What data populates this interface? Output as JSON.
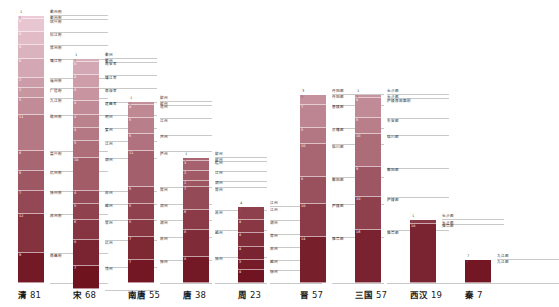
{
  "chart_data": {
    "type": "bar",
    "title": "",
    "subtitle": "",
    "xlabel": "",
    "ylabel": "",
    "orientation": "vertical-stacked",
    "grid": false,
    "legend": "none",
    "axis_note": "segment heights proportional to segment value; total shown under each bar",
    "categories": [
      "清",
      "宋",
      "南唐",
      "唐",
      "周",
      "晋",
      "三国",
      "西汉",
      "秦"
    ],
    "values": [
      81,
      68,
      55,
      38,
      23,
      57,
      57,
      19,
      7
    ],
    "colors": {
      "gradient_top": "#f0d2dd",
      "gradient_bottom": "#6d0f1c",
      "rule": "#c9c9c9",
      "segment_text_light": "#ffffff",
      "segment_text_dark": "#8a5a66",
      "label_text": "#2b2b2b",
      "footer_text": "#1a1a1a"
    },
    "series": [
      {
        "name": "清",
        "total": 81,
        "segments": [
          {
            "value": 1,
            "label": "衢州府"
          },
          {
            "value": 4,
            "label": "绍兴府"
          },
          {
            "value": 4,
            "label": "松江府"
          },
          {
            "value": 4,
            "label": "常州府"
          },
          {
            "value": 6,
            "label": "镇江府"
          },
          {
            "value": 3,
            "label": "福州府"
          },
          {
            "value": 3,
            "label": "广信府"
          },
          {
            "value": 5,
            "label": "九江府"
          },
          {
            "value": 11,
            "label": "徽州府"
          },
          {
            "value": 6,
            "label": "嘉兴府"
          },
          {
            "value": 6,
            "label": "杭州府"
          },
          {
            "value": 7,
            "label": "扬州府"
          },
          {
            "value": 12,
            "label": "苏州府"
          },
          {
            "value": 9,
            "label": "南昌府"
          }
        ]
      },
      {
        "name": "宋",
        "total": 68,
        "segments": [
          {
            "value": 1,
            "label": "衢州"
          },
          {
            "value": 4,
            "label": "南安军"
          },
          {
            "value": 4,
            "label": "镇江军"
          },
          {
            "value": 4,
            "label": "南康军"
          },
          {
            "value": 4,
            "label": "建昌军"
          },
          {
            "value": 4,
            "label": "明州"
          },
          {
            "value": 4,
            "label": "婺州"
          },
          {
            "value": 5,
            "label": "江州"
          },
          {
            "value": 10,
            "label": "湖州"
          },
          {
            "value": 4,
            "label": "苏州"
          },
          {
            "value": 5,
            "label": "越州"
          },
          {
            "value": 6,
            "label": "常州"
          },
          {
            "value": 8,
            "label": "杭州"
          },
          {
            "value": 7,
            "label": "饶州"
          }
        ]
      },
      {
        "name": "南唐",
        "total": 55,
        "segments": [
          {
            "value": 1,
            "label": "歙州"
          },
          {
            "value": 4,
            "label": "池州"
          },
          {
            "value": 5,
            "label": "江州"
          },
          {
            "value": 5,
            "label": "洪州"
          },
          {
            "value": 11,
            "label": "庐州"
          },
          {
            "value": 5,
            "label": "常州"
          },
          {
            "value": 5,
            "label": "润州"
          },
          {
            "value": 5,
            "label": "湖州"
          },
          {
            "value": 7,
            "label": "苏州"
          },
          {
            "value": 7,
            "label": "扬州"
          }
        ]
      },
      {
        "name": "唐",
        "total": 38,
        "segments": [
          {
            "value": 1,
            "label": "歙州"
          },
          {
            "value": 3,
            "label": "睦州"
          },
          {
            "value": 3,
            "label": "江州"
          },
          {
            "value": 2,
            "label": "湖州"
          },
          {
            "value": 7,
            "label": "常州"
          },
          {
            "value": 6,
            "label": "苏州"
          },
          {
            "value": 8,
            "label": "越州"
          },
          {
            "value": 8,
            "label": "扬州"
          }
        ]
      },
      {
        "name": "周",
        "total": 23,
        "segments": [
          {
            "value": 4,
            "label": "江州"
          },
          {
            "value": 4,
            "label": "湖州"
          },
          {
            "value": 4,
            "label": "常州"
          },
          {
            "value": 4,
            "label": "苏州"
          },
          {
            "value": 3,
            "label": "越州"
          },
          {
            "value": 4,
            "label": "扬州"
          }
        ]
      },
      {
        "name": "晋",
        "total": 57,
        "segments": [
          {
            "value": 3,
            "label": "丹阳郡"
          },
          {
            "value": 7,
            "label": "晋陵郡"
          },
          {
            "value": 5,
            "label": "会稽郡"
          },
          {
            "value": 10,
            "label": "临川郡"
          },
          {
            "value": 8,
            "label": "鄱阳郡"
          },
          {
            "value": 10,
            "label": "庐陵郡"
          },
          {
            "value": 14,
            "label": "豫章郡"
          }
        ]
      },
      {
        "name": "三国",
        "total": 57,
        "segments": [
          {
            "value": 1,
            "label": "长沙郡"
          },
          {
            "value": 6,
            "label": "庐陵南部都尉"
          },
          {
            "value": 5,
            "label": "东安郡"
          },
          {
            "value": 10,
            "label": "临川郡"
          },
          {
            "value": 9,
            "label": "鄱阳郡"
          },
          {
            "value": 10,
            "label": "庐陵郡"
          },
          {
            "value": 16,
            "label": "豫章郡"
          }
        ]
      },
      {
        "name": "西汉",
        "total": 19,
        "segments": [
          {
            "value": 1,
            "label": "长沙郡"
          },
          {
            "value": 18,
            "label": "豫章郡"
          }
        ]
      },
      {
        "name": "秦",
        "total": 7,
        "segments": [
          {
            "value": 7,
            "label": "九江郡"
          }
        ]
      }
    ]
  },
  "footer": {
    "labels": [
      {
        "name": "清",
        "count": "81"
      },
      {
        "name": "宋",
        "count": "68"
      },
      {
        "name": "南唐",
        "count": "55"
      },
      {
        "name": "唐",
        "count": "38"
      },
      {
        "name": "周",
        "count": "23"
      },
      {
        "name": "晋",
        "count": "57"
      },
      {
        "name": "三国",
        "count": "57"
      },
      {
        "name": "西汉",
        "count": "19"
      },
      {
        "name": "秦",
        "count": "7"
      }
    ]
  }
}
